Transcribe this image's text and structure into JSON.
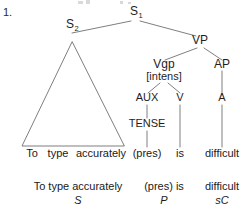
{
  "item": {
    "number": "1."
  },
  "tree": {
    "nodes": {
      "s1": {
        "label": "S",
        "subscript": "1"
      },
      "s2": {
        "label": "S",
        "subscript": "2"
      },
      "vp": {
        "label": "VP"
      },
      "vgp": {
        "label": "Vgp"
      },
      "vgp_feature": {
        "label": "[intens]"
      },
      "ap": {
        "label": "AP"
      },
      "aux": {
        "label": "AUX"
      },
      "v": {
        "label": "V"
      },
      "a": {
        "label": "A"
      },
      "tense": {
        "label": "TENSE"
      }
    }
  },
  "terminals": {
    "to": "To",
    "type": "type",
    "accurately": "accurately",
    "pres": "(pres)",
    "is": "is",
    "difficult": "difficult"
  },
  "analysis": {
    "subject": {
      "text": "To type accurately",
      "function": "S"
    },
    "predicator": {
      "text": "(pres) is",
      "function": "P"
    },
    "complement": {
      "text": "difficult",
      "function": "sC"
    }
  },
  "style": {
    "line_color": "#6f6f6f",
    "text_color": "#1a1a1a",
    "background": "#ffffff"
  }
}
